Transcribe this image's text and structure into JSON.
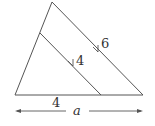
{
  "diagram": {
    "type": "similar-triangles",
    "colors": {
      "line": "#555555",
      "text": "#333333",
      "background": "#ffffff"
    },
    "labels": {
      "outer_side": "6",
      "inner_side": "4",
      "inner_base": "4",
      "outer_base": "a"
    },
    "annotations": {
      "parallel_marks": [
        "arrow on outer right side",
        "arrow on inner parallel segment"
      ],
      "dimension_arrow": "double-headed arrow spanning full base labeled a"
    }
  }
}
